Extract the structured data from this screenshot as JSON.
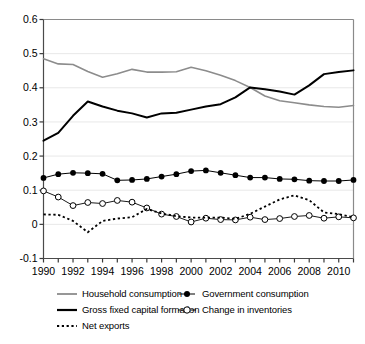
{
  "chart_data": {
    "type": "line",
    "title": "",
    "subtitle": "",
    "xlabel": "",
    "ylabel": "",
    "xlim": [
      1990,
      2011
    ],
    "ylim": [
      -0.1,
      0.6
    ],
    "yticks": [
      "-0.1",
      "0",
      "0.1",
      "0.2",
      "0.3",
      "0.4",
      "0.5",
      "0.6"
    ],
    "ytick_values": [
      -0.1,
      0,
      0.1,
      0.2,
      0.3,
      0.4,
      0.5,
      0.6
    ],
    "xticks": [
      "1990",
      "1992",
      "1994",
      "1996",
      "1998",
      "2000",
      "2002",
      "2004",
      "2006",
      "2008",
      "2010"
    ],
    "xtick_values": [
      1990,
      1992,
      1994,
      1996,
      1998,
      2000,
      2002,
      2004,
      2006,
      2008,
      2010
    ],
    "x": [
      1990,
      1991,
      1992,
      1993,
      1994,
      1995,
      1996,
      1997,
      1998,
      1999,
      2000,
      2001,
      2002,
      2003,
      2004,
      2005,
      2006,
      2007,
      2008,
      2009,
      2010,
      2011
    ],
    "grid": "horizontal",
    "grid_color": "#e8e8e8",
    "legend_position": "bottom",
    "series": [
      {
        "name": "Household consumption",
        "color": "#8c8c8c",
        "style": "solid",
        "marker": "none",
        "width": 1.6,
        "values": [
          0.485,
          0.47,
          0.468,
          0.448,
          0.431,
          0.441,
          0.454,
          0.446,
          0.446,
          0.447,
          0.46,
          0.45,
          0.437,
          0.421,
          0.401,
          0.376,
          0.362,
          0.356,
          0.35,
          0.345,
          0.343,
          0.348
        ]
      },
      {
        "name": "Government consumption",
        "color": "#000000",
        "style": "solid",
        "marker": "filled-circle",
        "width": 1.0,
        "values": [
          0.136,
          0.147,
          0.151,
          0.15,
          0.148,
          0.129,
          0.13,
          0.133,
          0.14,
          0.147,
          0.156,
          0.158,
          0.151,
          0.144,
          0.137,
          0.137,
          0.133,
          0.132,
          0.128,
          0.127,
          0.127,
          0.13
        ]
      },
      {
        "name": "Gross fixed capital formation",
        "color": "#000000",
        "style": "solid",
        "marker": "none",
        "width": 2.0,
        "values": [
          0.245,
          0.268,
          0.318,
          0.36,
          0.345,
          0.333,
          0.325,
          0.313,
          0.325,
          0.327,
          0.336,
          0.345,
          0.352,
          0.372,
          0.401,
          0.396,
          0.389,
          0.38,
          0.407,
          0.44,
          0.446,
          0.451
        ]
      },
      {
        "name": "Change in inventories",
        "color": "#000000",
        "style": "solid",
        "marker": "open-circle",
        "width": 0.9,
        "values": [
          0.098,
          0.08,
          0.055,
          0.064,
          0.061,
          0.07,
          0.065,
          0.048,
          0.03,
          0.023,
          0.007,
          0.018,
          0.014,
          0.013,
          0.021,
          0.014,
          0.017,
          0.023,
          0.026,
          0.018,
          0.022,
          0.019
        ]
      },
      {
        "name": "Net exports",
        "color": "#000000",
        "style": "dotted",
        "marker": "none",
        "width": 1.8,
        "values": [
          0.029,
          0.028,
          0.01,
          -0.023,
          0.01,
          0.017,
          0.021,
          0.045,
          0.032,
          0.024,
          0.02,
          0.02,
          0.02,
          0.016,
          0.031,
          0.052,
          0.073,
          0.085,
          0.071,
          0.035,
          0.03,
          0.021
        ]
      }
    ]
  },
  "legend": {
    "rows": [
      {
        "left": {
          "label": "Household consumption",
          "marker": "line-gray"
        },
        "right": {
          "label": "Government consumption",
          "marker": "line-filled-circle"
        }
      },
      {
        "left": {
          "label": "Gross fixed capital formation",
          "marker": "line-thick-black"
        },
        "right": {
          "label": "Change in inventories",
          "marker": "line-open-circle"
        }
      },
      {
        "left": {
          "label": "Net exports",
          "marker": "line-dotted"
        },
        "right": {
          "label": "",
          "marker": "none"
        }
      }
    ]
  }
}
